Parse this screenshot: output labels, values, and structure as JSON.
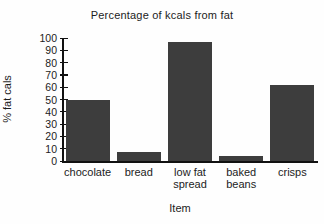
{
  "chart_data": {
    "type": "bar",
    "title": "Percentage of kcals from fat",
    "xlabel": "Item",
    "ylabel": "% fat cals",
    "categories": [
      "chocolate",
      "bread",
      "low fat spread",
      "baked beans",
      "crisps"
    ],
    "category_label_lines": [
      [
        "chocolate"
      ],
      [
        "bread"
      ],
      [
        "low fat",
        "spread"
      ],
      [
        "baked",
        "beans"
      ],
      [
        "crisps"
      ]
    ],
    "values": [
      50,
      7,
      97,
      4,
      62
    ],
    "ylim": [
      0,
      100
    ],
    "yticks": [
      0,
      10,
      20,
      30,
      40,
      50,
      60,
      70,
      80,
      90,
      100
    ],
    "grid": false,
    "legend": false,
    "bar_color": "#3d3d3d",
    "axis_color": "#111111",
    "background_color": "#fefefe"
  }
}
